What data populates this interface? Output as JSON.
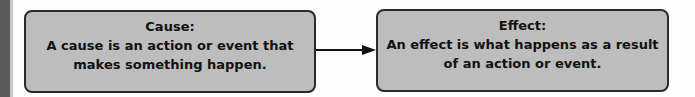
{
  "diagram": {
    "cause": {
      "title": "Cause:",
      "description": "A cause is an action or event that makes something happen."
    },
    "effect": {
      "title": "Effect:",
      "description": "An effect is what happens as a result of an action or event."
    },
    "connector": "arrow-right",
    "colors": {
      "box_fill": "#bdbdbd",
      "box_border": "#2a2a2a",
      "arrow": "#111111",
      "background": "#fdfdfd"
    }
  }
}
